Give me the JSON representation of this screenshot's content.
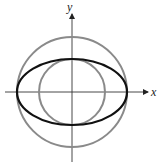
{
  "diagram": {
    "axes": {
      "x_label": "x",
      "y_label": "y"
    },
    "shapes": [
      {
        "name": "large-circle",
        "type": "circle",
        "cx": 72,
        "cy": 92,
        "r": 55,
        "stroke": "#8a8a8a"
      },
      {
        "name": "small-circle",
        "type": "circle",
        "cx": 72,
        "cy": 92,
        "r": 33,
        "stroke": "#8a8a8a"
      },
      {
        "name": "ellipse",
        "type": "ellipse",
        "cx": 72,
        "cy": 92,
        "rx": 55,
        "ry": 33,
        "stroke": "#111111"
      }
    ]
  }
}
